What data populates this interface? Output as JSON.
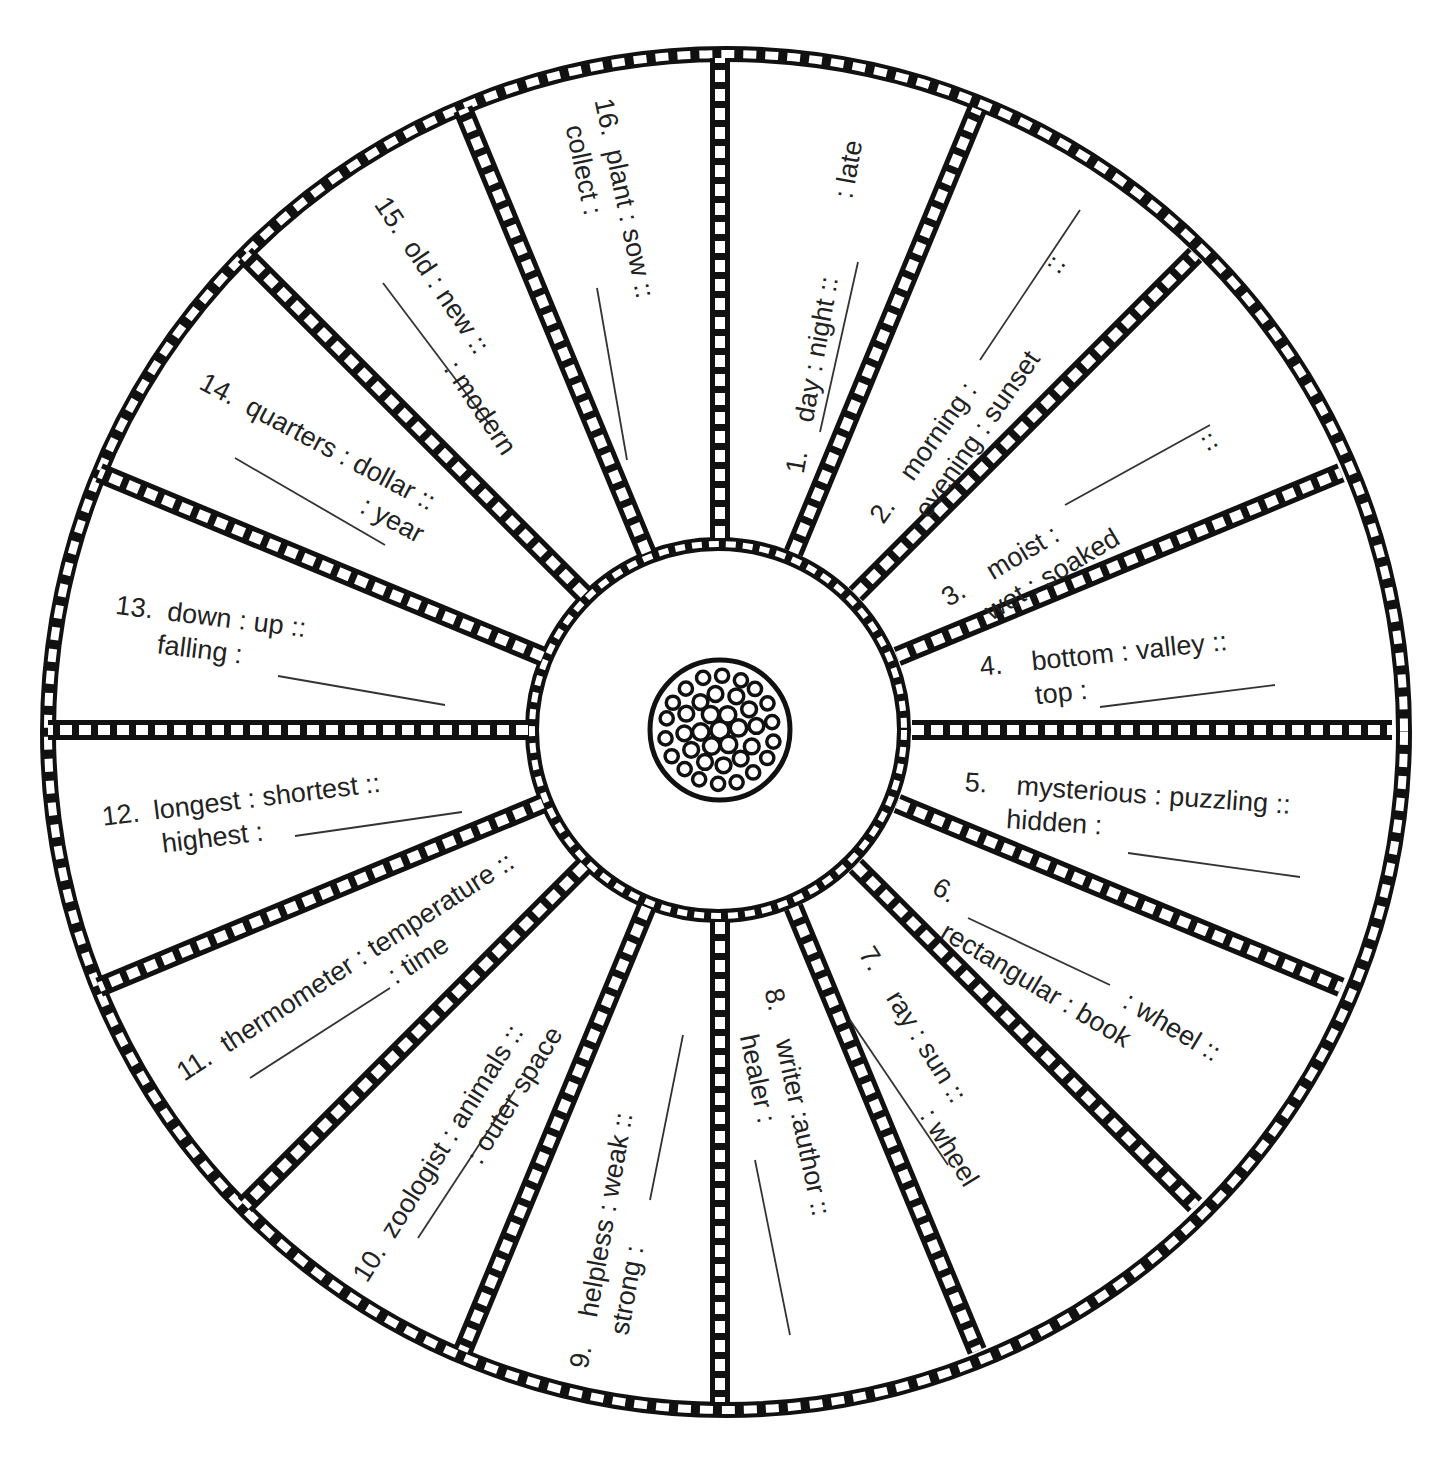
{
  "worksheet": {
    "type": "analogy-wheel",
    "segment_count": 16,
    "colors": {
      "ink": "#1a1a1a",
      "paper": "#ffffff"
    },
    "items": [
      {
        "number": "1.",
        "line1": "day : night ::",
        "line2": ": late",
        "blank_position": "start"
      },
      {
        "number": "2.",
        "line1": "morning :",
        "line2": "evening : sunset",
        "blank_after_line1": true,
        "trailing": "::"
      },
      {
        "number": "3.",
        "line1": "moist :",
        "line2": "wet : soaked",
        "blank_after_line1": true,
        "trailing": "::"
      },
      {
        "number": "4.",
        "line1": "bottom :  valley ::",
        "line2": "top :",
        "blank_position": "end"
      },
      {
        "number": "5.",
        "line1": "mysterious : puzzling ::",
        "line2": "hidden :",
        "blank_position": "end"
      },
      {
        "number": "6.",
        "line1": ": wheel ::",
        "line2": "rectangular : book",
        "blank_position": "start"
      },
      {
        "number": "7.",
        "line1": "ray : sun ::",
        "line2": ": wheel",
        "blank_position": "start"
      },
      {
        "number": "8.",
        "line1": "writer :author ::",
        "line2": "healer :",
        "blank_position": "end"
      },
      {
        "number": "9.",
        "line1": "helpless : weak ::",
        "line2": "strong :",
        "blank_position": "end"
      },
      {
        "number": "10.",
        "line1": "zoologist : animals ::",
        "line2": ": outer space",
        "blank_position": "start"
      },
      {
        "number": "11.",
        "line1": "thermometer : temperature ::",
        "line2": ": time",
        "blank_position": "start"
      },
      {
        "number": "12.",
        "line1": "longest : shortest ::",
        "line2": "highest :",
        "blank_position": "end"
      },
      {
        "number": "13.",
        "line1": "down : up ::",
        "line2": "falling :",
        "blank_position": "end"
      },
      {
        "number": "14.",
        "line1": "quarters : dollar ::",
        "line2": ": year",
        "blank_position": "start"
      },
      {
        "number": "15.",
        "line1": "old : new ::",
        "line2": ": modern",
        "blank_position": "start"
      },
      {
        "number": "16.",
        "line1": "plant : sow ::",
        "line2": "collect :",
        "blank_position": "end"
      }
    ],
    "center_icon": "cell-cluster-icon"
  }
}
